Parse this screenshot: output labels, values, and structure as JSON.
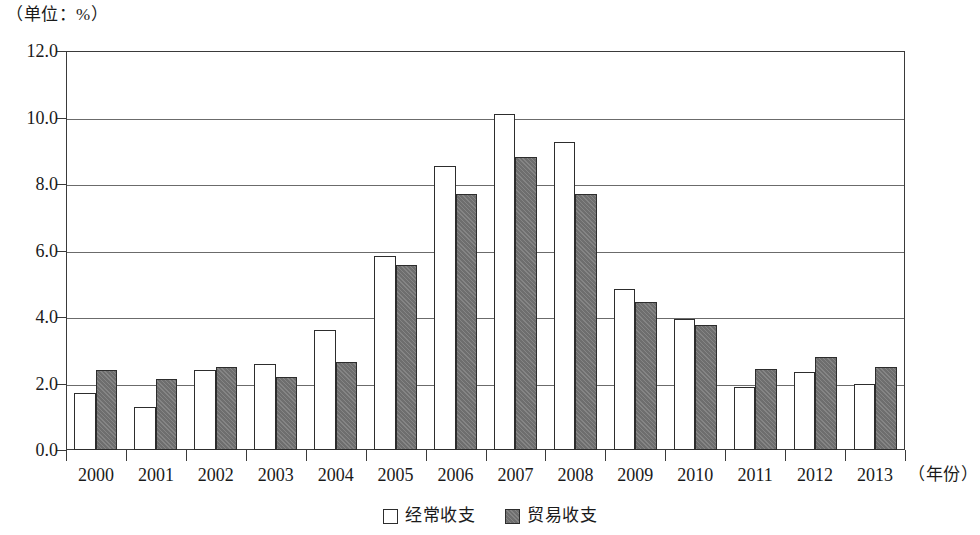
{
  "unit_caption": "（单位：%）",
  "x_axis_title": "（年份）",
  "legend": {
    "items": [
      {
        "label": "经常收支",
        "swatch": "hollow-white-square",
        "color": "#ffffff"
      },
      {
        "label": "贸易收支",
        "swatch": "filled-gray-square",
        "color": "#6e6e6e"
      }
    ]
  },
  "chart_data": {
    "type": "bar",
    "title": "",
    "subtitle": "",
    "xlabel": "（年份）",
    "ylabel": "（单位：%）",
    "categories": [
      "2000",
      "2001",
      "2002",
      "2003",
      "2004",
      "2005",
      "2006",
      "2007",
      "2008",
      "2009",
      "2010",
      "2011",
      "2012",
      "2013"
    ],
    "series": [
      {
        "name": "经常收支",
        "color": "#ffffff",
        "values": [
          1.7,
          1.3,
          2.4,
          2.6,
          3.6,
          5.85,
          8.55,
          10.1,
          9.25,
          4.85,
          3.95,
          1.9,
          2.35,
          2.0
        ]
      },
      {
        "name": "贸易收支",
        "color": "#6e6e6e",
        "values": [
          2.4,
          2.15,
          2.5,
          2.2,
          2.65,
          5.55,
          7.7,
          8.8,
          7.7,
          4.45,
          3.75,
          2.45,
          2.8,
          2.5
        ]
      }
    ],
    "ylim": [
      0.0,
      12.0
    ],
    "y_ticks": [
      0.0,
      2.0,
      4.0,
      6.0,
      8.0,
      10.0,
      12.0
    ],
    "y_tick_labels": [
      "0.0",
      "2.0",
      "4.0",
      "6.0",
      "8.0",
      "10.0",
      "12.0"
    ],
    "grid": "horizontal",
    "legend_position": "bottom-center"
  }
}
